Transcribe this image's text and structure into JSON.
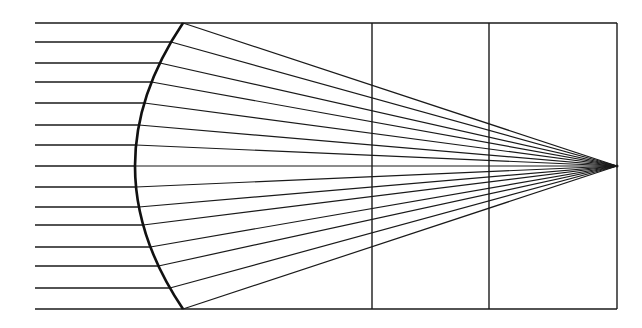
{
  "diagram": {
    "title": "",
    "colors": {
      "line": "#1a1a1a",
      "background": "#ffffff"
    },
    "frame": {
      "left": 183,
      "right": 617,
      "top": 23,
      "bottom": 309
    },
    "dividers_x": [
      372,
      489
    ],
    "lens": {
      "top": [
        183,
        23
      ],
      "apex": [
        135,
        166
      ],
      "bottom": [
        183,
        309
      ]
    },
    "focus": [
      617,
      166
    ],
    "ray_start_x": 35,
    "ray_y": [
      23,
      42,
      63,
      82,
      103,
      125,
      145,
      166,
      187,
      207,
      225,
      247,
      266,
      288,
      309
    ]
  }
}
